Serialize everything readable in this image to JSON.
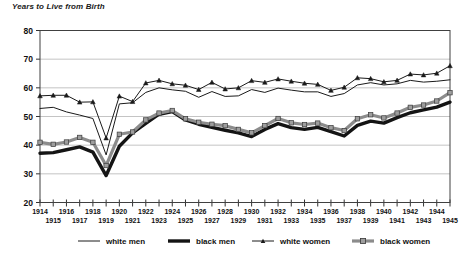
{
  "chart_data": {
    "type": "line",
    "title": "Years to Live from Birth",
    "xlabel": "",
    "ylabel": "",
    "ylim": [
      20,
      80
    ],
    "ytick_step": 10,
    "yticks": [
      20,
      30,
      40,
      50,
      60,
      70,
      80
    ],
    "grid": true,
    "legend_position": "bottom",
    "x": [
      1914,
      1915,
      1916,
      1917,
      1918,
      1919,
      1920,
      1921,
      1922,
      1923,
      1924,
      1925,
      1926,
      1927,
      1928,
      1929,
      1930,
      1931,
      1932,
      1933,
      1934,
      1935,
      1936,
      1937,
      1938,
      1939,
      1940,
      1941,
      1942,
      1943,
      1944,
      1945
    ],
    "xtick_labels_top": [
      "1914",
      "1916",
      "1918",
      "1920",
      "1922",
      "1924",
      "1926",
      "1928",
      "1930",
      "1932",
      "1934",
      "1936",
      "1938",
      "1940",
      "1942",
      "1944"
    ],
    "xtick_labels_bottom": [
      "1915",
      "1917",
      "1919",
      "1921",
      "1923",
      "1925",
      "1927",
      "1929",
      "1931",
      "1933",
      "1935",
      "1937",
      "1939",
      "1941",
      "1943",
      "1945"
    ],
    "series": [
      {
        "name": "white men",
        "color": "#1a1a1a",
        "width": 1,
        "marker": "none",
        "values": [
          52.8,
          53.2,
          51.6,
          50.5,
          49.3,
          36.6,
          54.4,
          54.8,
          58.4,
          60.0,
          59.3,
          58.8,
          56.7,
          58.7,
          57.0,
          57.2,
          59.4,
          58.4,
          59.9,
          59.2,
          58.6,
          58.6,
          57.0,
          58.0,
          61.0,
          61.8,
          61.0,
          61.4,
          62.6,
          62.0,
          62.3,
          62.8
        ]
      },
      {
        "name": "black men",
        "color": "#141414",
        "width": 3.4,
        "marker": "none",
        "values": [
          37.2,
          37.4,
          38.4,
          39.4,
          37.6,
          29.4,
          39.6,
          44.3,
          47.6,
          50.8,
          51.7,
          48.8,
          47.3,
          46.2,
          45.2,
          44.3,
          43.0,
          45.5,
          47.5,
          46.1,
          45.5,
          46.2,
          44.7,
          43.2,
          46.9,
          48.4,
          47.7,
          49.6,
          51.3,
          52.3,
          53.3,
          55.0
        ]
      },
      {
        "name": "white women",
        "color": "#1a1a1a",
        "width": 1,
        "marker": "triangle",
        "values": [
          57.2,
          57.4,
          57.4,
          55.0,
          55.1,
          42.5,
          57.1,
          55.2,
          61.7,
          62.6,
          61.4,
          60.9,
          59.4,
          61.9,
          59.6,
          60.0,
          62.5,
          61.9,
          63.1,
          62.3,
          61.6,
          61.2,
          59.1,
          60.2,
          63.5,
          63.2,
          62.1,
          62.6,
          64.8,
          64.5,
          65.1,
          67.7
        ]
      },
      {
        "name": "black women",
        "color": "#8c8c8c",
        "width": 3.2,
        "marker": "square",
        "values": [
          41.0,
          40.3,
          41.1,
          42.7,
          41.0,
          32.9,
          43.8,
          44.6,
          48.8,
          51.2,
          52.1,
          49.2,
          48.0,
          47.3,
          46.8,
          45.5,
          44.3,
          46.8,
          49.3,
          47.8,
          47.2,
          47.7,
          46.1,
          45.1,
          49.2,
          50.6,
          49.5,
          51.2,
          53.2,
          54.0,
          55.4,
          58.3
        ]
      }
    ]
  },
  "legend": {
    "items": [
      {
        "label": "white men"
      },
      {
        "label": "black men"
      },
      {
        "label": "white women"
      },
      {
        "label": "black women"
      }
    ]
  }
}
